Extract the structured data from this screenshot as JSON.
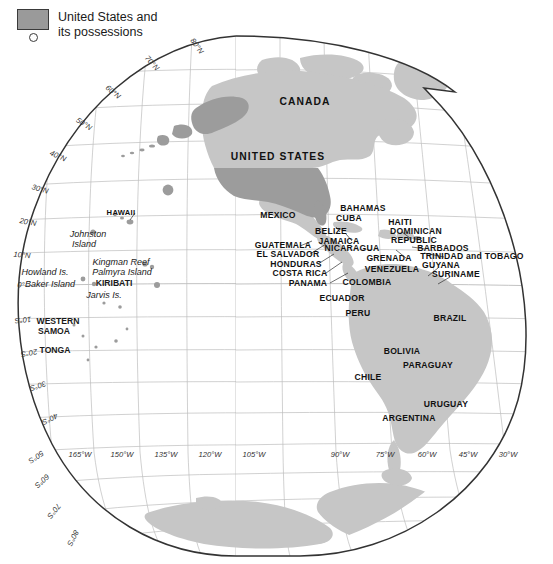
{
  "legend": {
    "title": "United States and\nits possessions",
    "swatch_color": "#9a9a9a",
    "swatch_border": "#3a3a3a",
    "point_symbol": "circle",
    "point_name": "small-island-symbol"
  },
  "map": {
    "projection": "interrupted-goode-homolosine",
    "hemisphere": "western",
    "background": "#ffffff",
    "outline_color": "#333333",
    "graticule_color": "#b9b9b9",
    "fill_us": "#9c9c9c",
    "fill_other": "#c6c6c6",
    "border_color": "#ffffff"
  },
  "graticule": {
    "latitude_labels": [
      {
        "text": "80°N",
        "x": 197,
        "y": 46,
        "rot": -36
      },
      {
        "text": "70°N",
        "x": 152,
        "y": 63,
        "rot": -42
      },
      {
        "text": "60°N",
        "x": 113,
        "y": 92,
        "rot": -50
      },
      {
        "text": "50°N",
        "x": 84,
        "y": 124,
        "rot": -58
      },
      {
        "text": "40°N",
        "x": 58,
        "y": 156,
        "rot": -66
      },
      {
        "text": "30°N",
        "x": 40,
        "y": 189,
        "rot": -74
      },
      {
        "text": "20°N",
        "x": 28,
        "y": 222,
        "rot": -80
      },
      {
        "text": "10°N",
        "x": 22,
        "y": 255,
        "rot": -85
      },
      {
        "text": "0°",
        "x": 21,
        "y": 285,
        "rot": -88
      },
      {
        "text": "10°S",
        "x": 23,
        "y": 320,
        "rot": 84
      },
      {
        "text": "20°S",
        "x": 29,
        "y": 353,
        "rot": 79
      },
      {
        "text": "30°S",
        "x": 38,
        "y": 386,
        "rot": 72
      },
      {
        "text": "40°S",
        "x": 50,
        "y": 419,
        "rot": 64
      },
      {
        "text": "50°S",
        "x": 36,
        "y": 457,
        "rot": 56
      },
      {
        "text": "60°S",
        "x": 42,
        "y": 481,
        "rot": 48
      },
      {
        "text": "70°S",
        "x": 54,
        "y": 511,
        "rot": 38
      },
      {
        "text": "80°S",
        "x": 73,
        "y": 538,
        "rot": 27
      }
    ],
    "longitude_labels_left": [
      {
        "text": "165°W",
        "x": 80,
        "y": 454
      },
      {
        "text": "150°W",
        "x": 122,
        "y": 454
      },
      {
        "text": "135°W",
        "x": 166,
        "y": 454
      },
      {
        "text": "120°W",
        "x": 210,
        "y": 454
      },
      {
        "text": "105°W",
        "x": 254,
        "y": 454
      }
    ],
    "longitude_labels_right": [
      {
        "text": "90°W",
        "x": 340,
        "y": 454
      },
      {
        "text": "75°W",
        "x": 385,
        "y": 454
      },
      {
        "text": "60°W",
        "x": 427,
        "y": 454
      },
      {
        "text": "45°W",
        "x": 468,
        "y": 454
      },
      {
        "text": "30°W",
        "x": 508,
        "y": 454
      }
    ]
  },
  "places": {
    "continents": [
      {
        "name": "CANADA",
        "x": 305,
        "y": 101,
        "size": "big"
      },
      {
        "name": "UNITED STATES",
        "x": 278,
        "y": 156,
        "size": "big"
      }
    ],
    "countries": [
      {
        "name": "MEXICO",
        "x": 278,
        "y": 215
      },
      {
        "name": "BAHAMAS",
        "x": 363,
        "y": 208
      },
      {
        "name": "CUBA",
        "x": 349,
        "y": 218
      },
      {
        "name": "HAITI",
        "x": 400,
        "y": 222
      },
      {
        "name": "BELIZE",
        "x": 331,
        "y": 231
      },
      {
        "name": "DOMINICAN",
        "x": 416,
        "y": 231
      },
      {
        "name": "REPUBLIC",
        "x": 414,
        "y": 240
      },
      {
        "name": "JAMAICA",
        "x": 339,
        "y": 241
      },
      {
        "name": "NICARAGUA",
        "x": 352,
        "y": 248
      },
      {
        "name": "GUATEMALA",
        "x": 283,
        "y": 245
      },
      {
        "name": "BARBADOS",
        "x": 443,
        "y": 248
      },
      {
        "name": "EL SALVADOR",
        "x": 288,
        "y": 254
      },
      {
        "name": "GRENADA",
        "x": 389,
        "y": 258
      },
      {
        "name": "TRINIDAD and TOBAGO",
        "x": 472,
        "y": 256
      },
      {
        "name": "HONDURAS",
        "x": 296,
        "y": 264
      },
      {
        "name": "GUYANA",
        "x": 441,
        "y": 265
      },
      {
        "name": "VENEZUELA",
        "x": 392,
        "y": 269
      },
      {
        "name": "COSTA RICA",
        "x": 300,
        "y": 273
      },
      {
        "name": "SURINAME",
        "x": 456,
        "y": 274
      },
      {
        "name": "PANAMA",
        "x": 308,
        "y": 283
      },
      {
        "name": "COLOMBIA",
        "x": 367,
        "y": 282
      },
      {
        "name": "ECUADOR",
        "x": 342,
        "y": 298
      },
      {
        "name": "PERU",
        "x": 358,
        "y": 313
      },
      {
        "name": "BRAZIL",
        "x": 450,
        "y": 318
      },
      {
        "name": "BOLIVIA",
        "x": 402,
        "y": 351
      },
      {
        "name": "PARAGUAY",
        "x": 428,
        "y": 365
      },
      {
        "name": "CHILE",
        "x": 368,
        "y": 377
      },
      {
        "name": "URUGUAY",
        "x": 446,
        "y": 404
      },
      {
        "name": "ARGENTINA",
        "x": 409,
        "y": 418
      }
    ],
    "islands": [
      {
        "name": "HAWAII",
        "x": 121,
        "y": 212,
        "style": "hawaii"
      },
      {
        "name": "Johnston",
        "x": 88,
        "y": 234,
        "style": "italic"
      },
      {
        "name": "Island",
        "x": 84,
        "y": 244,
        "style": "italic"
      },
      {
        "name": "Kingman Reef",
        "x": 121,
        "y": 262,
        "style": "italic"
      },
      {
        "name": "Palmyra Island",
        "x": 122,
        "y": 272,
        "style": "italic"
      },
      {
        "name": "KIRIBATI",
        "x": 114,
        "y": 283,
        "style": "caps"
      },
      {
        "name": "Howland Is.",
        "x": 45,
        "y": 272,
        "style": "italic"
      },
      {
        "name": "Baker Island",
        "x": 50,
        "y": 284,
        "style": "italic"
      },
      {
        "name": "Jarvis Is.",
        "x": 104,
        "y": 295,
        "style": "italic"
      },
      {
        "name": "WESTERN",
        "x": 58,
        "y": 321,
        "style": "caps"
      },
      {
        "name": "SAMOA",
        "x": 54,
        "y": 331,
        "style": "caps"
      },
      {
        "name": "TONGA",
        "x": 55,
        "y": 350,
        "style": "caps"
      }
    ]
  }
}
